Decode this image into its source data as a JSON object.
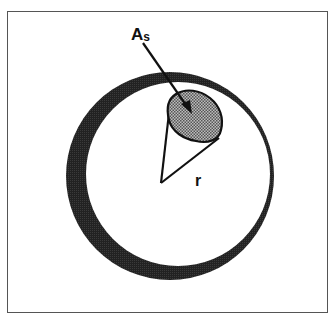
{
  "figure": {
    "labels": {
      "area_label_main": "A",
      "area_label_sub": "s",
      "radius_label": "r"
    },
    "colors": {
      "ring": "#1a1a1a",
      "patch_fill": "#8a8a8a",
      "line": "#111111",
      "frame": "#555555",
      "background": "#ffffff"
    }
  }
}
